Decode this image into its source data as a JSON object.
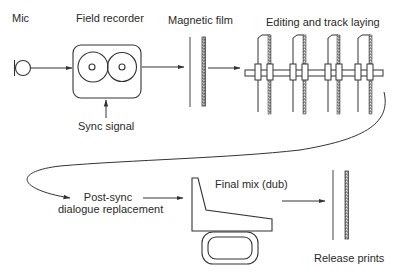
{
  "diagram": {
    "type": "film sound production workflow",
    "labels": {
      "mic": "Mic",
      "field_recorder": "Field recorder",
      "sync_signal": "Sync signal",
      "magnetic_film": "Magnetic film",
      "editing": "Editing and track laying",
      "post_sync_line1": "Post-sync",
      "post_sync_line2": "dialogue replacement",
      "final_mix": "Final mix (dub)",
      "release_prints": "Release prints"
    },
    "nodes": [
      {
        "id": "mic",
        "label": "Mic",
        "icon": "microphone-icon"
      },
      {
        "id": "field_recorder",
        "label": "Field recorder",
        "icon": "tape-recorder-icon"
      },
      {
        "id": "magnetic_film",
        "label": "Magnetic film",
        "icon": "film-strip-icon"
      },
      {
        "id": "editing",
        "label": "Editing and track laying",
        "icon": "synchroniser-icon"
      },
      {
        "id": "post_sync",
        "label": "Post-sync dialogue replacement"
      },
      {
        "id": "final_mix",
        "label": "Final mix (dub)",
        "icon": "mixing-console-icon"
      },
      {
        "id": "release_prints",
        "label": "Release prints",
        "icon": "film-strip-icon"
      }
    ],
    "edges": [
      {
        "from": "mic",
        "to": "field_recorder"
      },
      {
        "from": "sync_signal",
        "to": "field_recorder"
      },
      {
        "from": "field_recorder",
        "to": "magnetic_film"
      },
      {
        "from": "magnetic_film",
        "to": "editing"
      },
      {
        "from": "editing",
        "to": "post_sync"
      },
      {
        "from": "post_sync",
        "to": "final_mix"
      },
      {
        "from": "final_mix",
        "to": "release_prints"
      }
    ],
    "colors": {
      "line": "#333333",
      "text": "#2a2a2a",
      "background": "#ffffff"
    }
  }
}
